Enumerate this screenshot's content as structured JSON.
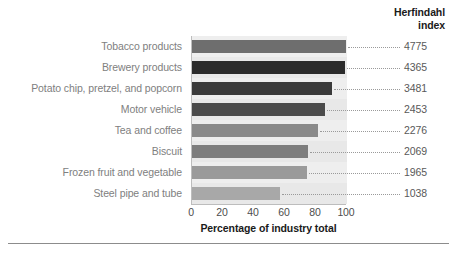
{
  "header": {
    "line1": "Herfindahl",
    "line2": "index"
  },
  "axis": {
    "x_title": "Percentage of industry total",
    "x_ticks": [
      "0",
      "20",
      "40",
      "60",
      "80",
      "100"
    ]
  },
  "chart_data": {
    "type": "bar",
    "orientation": "horizontal",
    "title": "",
    "xlabel": "Percentage of industry total",
    "ylabel": "",
    "xlim": [
      0,
      100
    ],
    "grid": false,
    "legend": null,
    "categories": [
      "Tobacco products",
      "Brewery products",
      "Potato chip, pretzel, and popcorn",
      "Motor vehicle",
      "Tea and coffee",
      "Biscuit",
      "Frozen fruit and vegetable",
      "Steel pipe and tube"
    ],
    "values": [
      99.5,
      98.5,
      90,
      86,
      81,
      75,
      74,
      57
    ],
    "bar_colors": [
      "#6e6e6e",
      "#2b2b2b",
      "#3a3a3a",
      "#4a4a4a",
      "#8a8a8a",
      "#7d7d7d",
      "#9a9a9a",
      "#a8a8a8"
    ],
    "annotations": {
      "series_name": "Herfindahl index",
      "labels": [
        "4775",
        "4365",
        "3481",
        "2453",
        "2276",
        "2069",
        "1965",
        "1038"
      ]
    }
  }
}
